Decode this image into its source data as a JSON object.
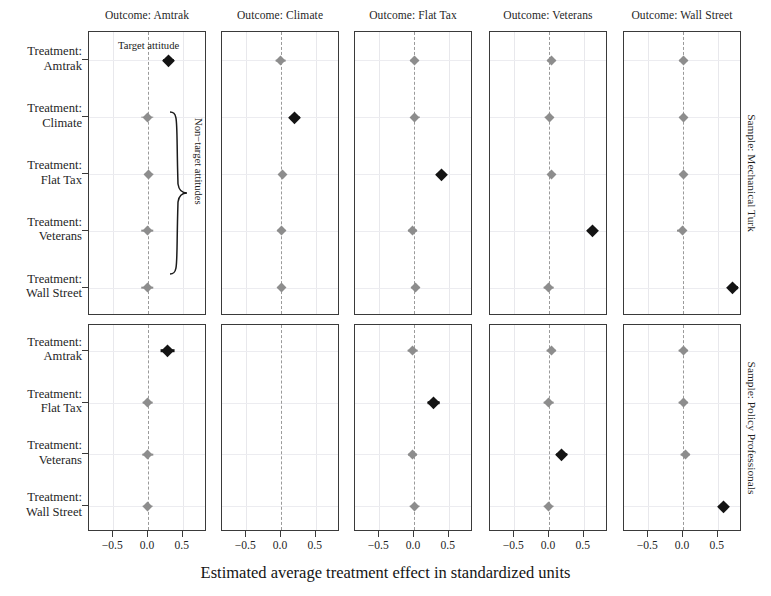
{
  "figure": {
    "xaxis_title": "Estimated average treatment effect in standardized units",
    "tick_labels": [
      "−0.5",
      "0.0",
      "0.5"
    ],
    "tick_values": [
      -0.5,
      0.0,
      0.5
    ],
    "annotation_target": "Target attitude",
    "annotation_nontarget": "Non−target attitudes",
    "colors": {
      "target": "#141414",
      "nontarget": "#8d8d8d",
      "zeroline": "#9a9a9a",
      "panel_border": "#3a3a3a",
      "grid": "#e8e8ec"
    }
  },
  "columns": [
    {
      "title": "Outcome: Amtrak"
    },
    {
      "title": "Outcome: Climate"
    },
    {
      "title": "Outcome: Flat Tax"
    },
    {
      "title": "Outcome: Veterans"
    },
    {
      "title": "Outcome: Wall Street"
    }
  ],
  "rows_top": [
    {
      "l1": "Treatment:",
      "l2": "Amtrak"
    },
    {
      "l1": "Treatment:",
      "l2": "Climate"
    },
    {
      "l1": "Treatment:",
      "l2": "Flat Tax"
    },
    {
      "l1": "Treatment:",
      "l2": "Veterans"
    },
    {
      "l1": "Treatment:",
      "l2": "Wall Street"
    }
  ],
  "rows_bottom": [
    {
      "l1": "Treatment:",
      "l2": "Amtrak"
    },
    {
      "l1": "Treatment:",
      "l2": "Flat Tax"
    },
    {
      "l1": "Treatment:",
      "l2": "Veterans"
    },
    {
      "l1": "Treatment:",
      "l2": "Wall Street"
    }
  ],
  "strips_right": [
    {
      "title": "Sample: Mechanical Turk"
    },
    {
      "title": "Sample: Policy Professionals"
    }
  ],
  "chart_data": {
    "type": "scatter",
    "title": "",
    "xlabel": "Estimated average treatment effect in standardized units",
    "ylabel": "",
    "xlim": [
      -0.85,
      0.85
    ],
    "xticks": [
      -0.5,
      0.0,
      0.5
    ],
    "grid": true,
    "legend": "none",
    "facet_cols": [
      "Outcome: Amtrak",
      "Outcome: Climate",
      "Outcome: Flat Tax",
      "Outcome: Veterans",
      "Outcome: Wall Street"
    ],
    "facet_rows": [
      "Sample: Mechanical Turk",
      "Sample: Policy Professionals"
    ],
    "marker_kinds": {
      "target": "filled dark diamond with 95% CI",
      "nontarget": "grey diamond with 95% CI"
    },
    "panels": [
      {
        "sample": "Sample: Mechanical Turk",
        "outcome": "Outcome: Amtrak",
        "points": [
          {
            "treatment": "Treatment: Amtrak",
            "estimate": 0.29,
            "ci_low": 0.21,
            "ci_high": 0.37,
            "kind": "target"
          },
          {
            "treatment": "Treatment: Climate",
            "estimate": -0.01,
            "ci_low": -0.1,
            "ci_high": 0.08,
            "kind": "nontarget"
          },
          {
            "treatment": "Treatment: Flat Tax",
            "estimate": 0.01,
            "ci_low": -0.05,
            "ci_high": 0.07,
            "kind": "nontarget"
          },
          {
            "treatment": "Treatment: Veterans",
            "estimate": -0.01,
            "ci_low": -0.1,
            "ci_high": 0.08,
            "kind": "nontarget"
          },
          {
            "treatment": "Treatment: Wall Street",
            "estimate": -0.01,
            "ci_low": -0.1,
            "ci_high": 0.08,
            "kind": "nontarget"
          }
        ]
      },
      {
        "sample": "Sample: Mechanical Turk",
        "outcome": "Outcome: Climate",
        "points": [
          {
            "treatment": "Treatment: Amtrak",
            "estimate": -0.01,
            "ci_low": -0.08,
            "ci_high": 0.06,
            "kind": "nontarget"
          },
          {
            "treatment": "Treatment: Climate",
            "estimate": 0.2,
            "ci_low": 0.13,
            "ci_high": 0.27,
            "kind": "target"
          },
          {
            "treatment": "Treatment: Flat Tax",
            "estimate": 0.02,
            "ci_low": -0.04,
            "ci_high": 0.07,
            "kind": "nontarget"
          },
          {
            "treatment": "Treatment: Veterans",
            "estimate": 0.0,
            "ci_low": -0.06,
            "ci_high": 0.06,
            "kind": "nontarget"
          },
          {
            "treatment": "Treatment: Wall Street",
            "estimate": 0.01,
            "ci_low": -0.05,
            "ci_high": 0.06,
            "kind": "nontarget"
          }
        ]
      },
      {
        "sample": "Sample: Mechanical Turk",
        "outcome": "Outcome: Flat Tax",
        "points": [
          {
            "treatment": "Treatment: Amtrak",
            "estimate": 0.0,
            "ci_low": -0.06,
            "ci_high": 0.06,
            "kind": "nontarget"
          },
          {
            "treatment": "Treatment: Climate",
            "estimate": 0.01,
            "ci_low": -0.05,
            "ci_high": 0.08,
            "kind": "nontarget"
          },
          {
            "treatment": "Treatment: Flat Tax",
            "estimate": 0.39,
            "ci_low": 0.32,
            "ci_high": 0.46,
            "kind": "target"
          },
          {
            "treatment": "Treatment: Veterans",
            "estimate": -0.02,
            "ci_low": -0.08,
            "ci_high": 0.05,
            "kind": "nontarget"
          },
          {
            "treatment": "Treatment: Wall Street",
            "estimate": 0.02,
            "ci_low": -0.04,
            "ci_high": 0.08,
            "kind": "nontarget"
          }
        ]
      },
      {
        "sample": "Sample: Mechanical Turk",
        "outcome": "Outcome: Veterans",
        "points": [
          {
            "treatment": "Treatment: Amtrak",
            "estimate": 0.03,
            "ci_low": -0.03,
            "ci_high": 0.09,
            "kind": "nontarget"
          },
          {
            "treatment": "Treatment: Climate",
            "estimate": 0.0,
            "ci_low": -0.07,
            "ci_high": 0.07,
            "kind": "nontarget"
          },
          {
            "treatment": "Treatment: Flat Tax",
            "estimate": 0.03,
            "ci_low": -0.02,
            "ci_high": 0.09,
            "kind": "nontarget"
          },
          {
            "treatment": "Treatment: Veterans",
            "estimate": 0.62,
            "ci_low": 0.55,
            "ci_high": 0.69,
            "kind": "target"
          },
          {
            "treatment": "Treatment: Wall Street",
            "estimate": -0.01,
            "ci_low": -0.08,
            "ci_high": 0.06,
            "kind": "nontarget"
          }
        ]
      },
      {
        "sample": "Sample: Mechanical Turk",
        "outcome": "Outcome: Wall Street",
        "points": [
          {
            "treatment": "Treatment: Amtrak",
            "estimate": 0.0,
            "ci_low": -0.06,
            "ci_high": 0.06,
            "kind": "nontarget"
          },
          {
            "treatment": "Treatment: Climate",
            "estimate": 0.0,
            "ci_low": -0.06,
            "ci_high": 0.06,
            "kind": "nontarget"
          },
          {
            "treatment": "Treatment: Flat Tax",
            "estimate": 0.0,
            "ci_low": -0.06,
            "ci_high": 0.06,
            "kind": "nontarget"
          },
          {
            "treatment": "Treatment: Veterans",
            "estimate": -0.01,
            "ci_low": -0.08,
            "ci_high": 0.05,
            "kind": "nontarget"
          },
          {
            "treatment": "Treatment: Wall Street",
            "estimate": 0.72,
            "ci_low": 0.66,
            "ci_high": 0.79,
            "kind": "target"
          }
        ]
      },
      {
        "sample": "Sample: Policy Professionals",
        "outcome": "Outcome: Amtrak",
        "points": [
          {
            "treatment": "Treatment: Amtrak",
            "estimate": 0.28,
            "ci_low": 0.18,
            "ci_high": 0.38,
            "kind": "target"
          },
          {
            "treatment": "Treatment: Flat Tax",
            "estimate": -0.01,
            "ci_low": -0.08,
            "ci_high": 0.06,
            "kind": "nontarget"
          },
          {
            "treatment": "Treatment: Veterans",
            "estimate": -0.01,
            "ci_low": -0.08,
            "ci_high": 0.07,
            "kind": "nontarget"
          },
          {
            "treatment": "Treatment: Wall Street",
            "estimate": -0.01,
            "ci_low": -0.08,
            "ci_high": 0.06,
            "kind": "nontarget"
          }
        ]
      },
      {
        "sample": "Sample: Policy Professionals",
        "outcome": "Outcome: Climate",
        "points": []
      },
      {
        "sample": "Sample: Policy Professionals",
        "outcome": "Outcome: Flat Tax",
        "points": [
          {
            "treatment": "Treatment: Amtrak",
            "estimate": -0.02,
            "ci_low": -0.09,
            "ci_high": 0.05,
            "kind": "nontarget"
          },
          {
            "treatment": "Treatment: Flat Tax",
            "estimate": 0.28,
            "ci_low": 0.2,
            "ci_high": 0.37,
            "kind": "target"
          },
          {
            "treatment": "Treatment: Veterans",
            "estimate": -0.02,
            "ci_low": -0.09,
            "ci_high": 0.04,
            "kind": "nontarget"
          },
          {
            "treatment": "Treatment: Wall Street",
            "estimate": 0.01,
            "ci_low": -0.06,
            "ci_high": 0.08,
            "kind": "nontarget"
          }
        ]
      },
      {
        "sample": "Sample: Policy Professionals",
        "outcome": "Outcome: Veterans",
        "points": [
          {
            "treatment": "Treatment: Amtrak",
            "estimate": 0.03,
            "ci_low": -0.04,
            "ci_high": 0.1,
            "kind": "nontarget"
          },
          {
            "treatment": "Treatment: Flat Tax",
            "estimate": -0.01,
            "ci_low": -0.08,
            "ci_high": 0.06,
            "kind": "nontarget"
          },
          {
            "treatment": "Treatment: Veterans",
            "estimate": 0.18,
            "ci_low": 0.11,
            "ci_high": 0.26,
            "kind": "target"
          },
          {
            "treatment": "Treatment: Wall Street",
            "estimate": -0.01,
            "ci_low": -0.08,
            "ci_high": 0.06,
            "kind": "nontarget"
          }
        ]
      },
      {
        "sample": "Sample: Policy Professionals",
        "outcome": "Outcome: Wall Street",
        "points": [
          {
            "treatment": "Treatment: Amtrak",
            "estimate": 0.0,
            "ci_low": -0.07,
            "ci_high": 0.07,
            "kind": "nontarget"
          },
          {
            "treatment": "Treatment: Flat Tax",
            "estimate": 0.0,
            "ci_low": -0.07,
            "ci_high": 0.07,
            "kind": "nontarget"
          },
          {
            "treatment": "Treatment: Veterans",
            "estimate": 0.03,
            "ci_low": -0.04,
            "ci_high": 0.1,
            "kind": "nontarget"
          },
          {
            "treatment": "Treatment: Wall Street",
            "estimate": 0.58,
            "ci_low": 0.51,
            "ci_high": 0.65,
            "kind": "target"
          }
        ]
      }
    ]
  }
}
